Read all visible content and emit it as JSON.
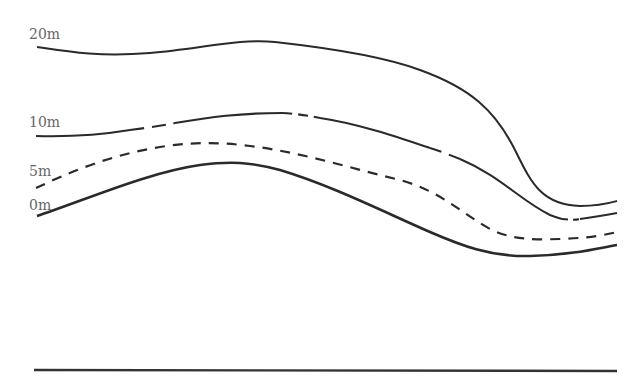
{
  "diagram": {
    "type": "contour-cross-section",
    "colors": {
      "line": "#2a2a2a",
      "label": "#666666",
      "background": "#ffffff"
    },
    "contours": [
      {
        "id": "c20",
        "label": "20m",
        "style": "solid",
        "label_pos": [
          30,
          29
        ]
      },
      {
        "id": "c10",
        "label": "10m",
        "style": "mixed",
        "label_pos": [
          29,
          117
        ]
      },
      {
        "id": "c5",
        "label": "5m",
        "style": "dashed",
        "label_pos": [
          29,
          164
        ]
      },
      {
        "id": "c0",
        "label": "0m",
        "style": "solid",
        "label_pos": [
          29,
          199
        ]
      }
    ],
    "baseline": {
      "style": "solid"
    }
  }
}
